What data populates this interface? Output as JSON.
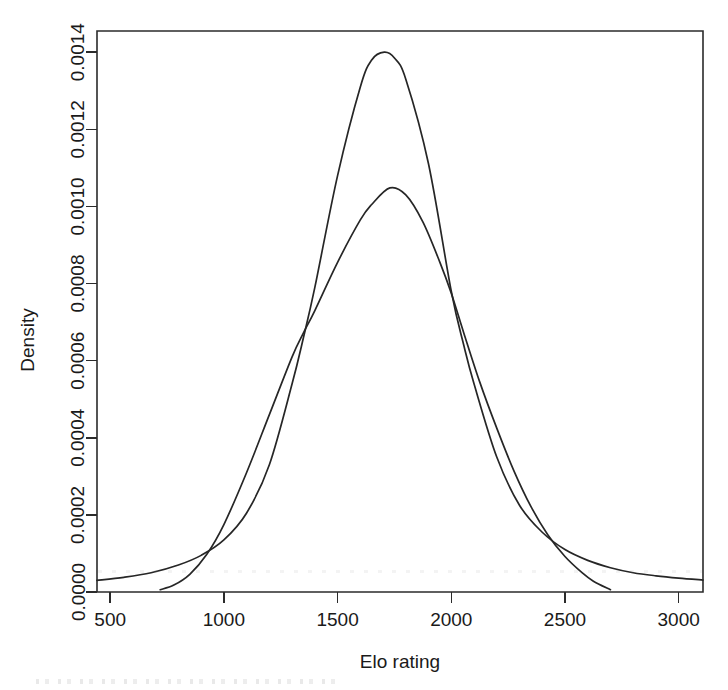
{
  "chart_data": {
    "type": "line",
    "title": "",
    "subtitle": "",
    "xlabel": "Elo rating",
    "ylabel": "Density",
    "xlim": [
      442,
      3107
    ],
    "ylim": [
      0.0,
      0.001455
    ],
    "xticks": [
      500,
      1000,
      1500,
      2000,
      2500,
      3000
    ],
    "xtick_labels": [
      "500",
      "1000",
      "1500",
      "2000",
      "2500",
      "3000"
    ],
    "yticks": [
      0.0,
      0.0002,
      0.0004,
      0.0006,
      0.0008,
      0.001,
      0.0012,
      0.0014
    ],
    "ytick_labels": [
      "0.0000",
      "0.0002",
      "0.0004",
      "0.0006",
      "0.0008",
      "0.0010",
      "0.0012",
      "0.0014"
    ],
    "grid": false,
    "legend": null,
    "legend_position": "none",
    "box": true,
    "annotations": [],
    "series": [
      {
        "name": "narrow-tall-density",
        "peak_x": 1705,
        "peak_y": 0.0014,
        "x_start": 442,
        "x_end": 3107,
        "x": [
          442,
          560,
          680,
          800,
          900,
          1000,
          1100,
          1200,
          1300,
          1350,
          1400,
          1500,
          1600,
          1650,
          1705,
          1750,
          1800,
          1900,
          2000,
          2055,
          2100,
          2200,
          2300,
          2400,
          2500,
          2600,
          2700,
          2800,
          2900,
          3000,
          3107
        ],
        "values": [
          3e-05,
          3.8e-05,
          5e-05,
          7e-05,
          9.5e-05,
          0.000135,
          0.000205,
          0.00033,
          0.00054,
          0.00066,
          0.00079,
          0.00108,
          0.00131,
          0.00138,
          0.0014,
          0.001385,
          0.00133,
          0.00111,
          0.00078,
          0.00064,
          0.00054,
          0.00035,
          0.000225,
          0.000155,
          0.00011,
          8.2e-05,
          6.3e-05,
          5e-05,
          4.2e-05,
          3.6e-05,
          3.1e-05
        ]
      },
      {
        "name": "broad-low-density",
        "peak_x": 1730,
        "peak_y": 0.00105,
        "x_start": 720,
        "x_end": 2700,
        "x": [
          720,
          780,
          850,
          925,
          1000,
          1100,
          1200,
          1300,
          1350,
          1400,
          1500,
          1600,
          1650,
          1730,
          1800,
          1875,
          1950,
          2000,
          2055,
          2125,
          2200,
          2275,
          2350,
          2425,
          2500,
          2575,
          2625,
          2700
        ],
        "values": [
          6e-06,
          1.8e-05,
          4.6e-05,
          9.8e-05,
          0.000175,
          0.00031,
          0.00046,
          0.00061,
          0.000672,
          0.00073,
          0.000855,
          0.000965,
          0.001005,
          0.001048,
          0.00103,
          0.00096,
          0.000855,
          0.000775,
          0.000672,
          0.000545,
          0.000425,
          0.000315,
          0.000222,
          0.000148,
          9.2e-05,
          5e-05,
          2.8e-05,
          6e-06
        ]
      }
    ],
    "crossings": [
      {
        "x": 1350,
        "y": 0.000666
      },
      {
        "x": 2055,
        "y": 0.00064
      }
    ]
  },
  "axes": {
    "x_title": "Elo rating",
    "y_title": "Density"
  },
  "colors": {
    "curve": "#262626",
    "axis": "#2b2b2b",
    "background": "#ffffff",
    "text": "#1a1a1a"
  }
}
